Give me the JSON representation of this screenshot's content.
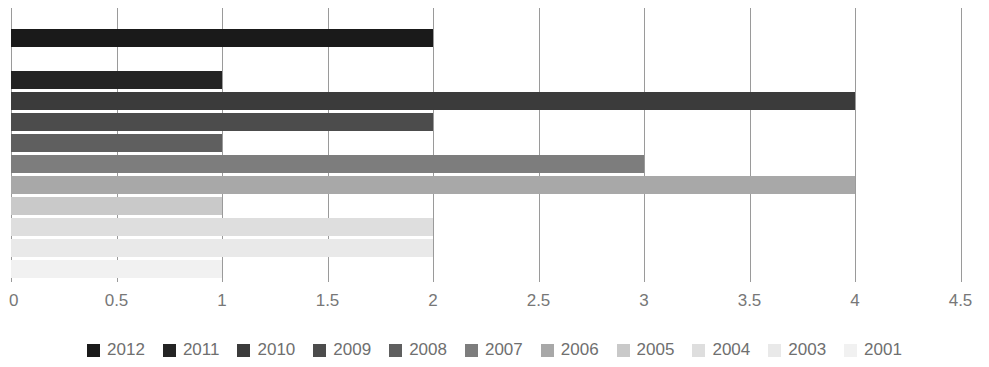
{
  "chart_data": {
    "type": "bar",
    "orientation": "horizontal",
    "title": "",
    "subtitle": "",
    "xlabel": "",
    "ylabel": "",
    "xlim": [
      0,
      4.5
    ],
    "grid": true,
    "grid_axis": "x",
    "legend_position": "bottom",
    "categories": [
      "2012",
      "2011",
      "2010",
      "2009",
      "2008",
      "2007",
      "2006",
      "2005",
      "2004",
      "2003",
      "2001"
    ],
    "values": [
      2,
      1,
      4,
      2,
      1,
      3,
      4,
      1,
      2,
      2,
      1
    ],
    "tick_labels": [
      "0",
      "0.5",
      "1",
      "1.5",
      "2",
      "2.5",
      "3",
      "3.5",
      "4",
      "4.5"
    ],
    "tick_values": [
      0,
      0.5,
      1,
      1.5,
      2,
      2.5,
      3,
      3.5,
      4,
      4.5
    ],
    "series": [
      {
        "name": "2012",
        "value": 2,
        "color": "#1a1a1a"
      },
      {
        "name": "2011",
        "value": 1,
        "color": "#242424"
      },
      {
        "name": "2010",
        "value": 4,
        "color": "#3b3b3b"
      },
      {
        "name": "2009",
        "value": 2,
        "color": "#4c4c4c"
      },
      {
        "name": "2008",
        "value": 1,
        "color": "#5f5f5f"
      },
      {
        "name": "2007",
        "value": 3,
        "color": "#7d7d7d"
      },
      {
        "name": "2006",
        "value": 4,
        "color": "#a8a8a8"
      },
      {
        "name": "2005",
        "value": 1,
        "color": "#c9c9c9"
      },
      {
        "name": "2004",
        "value": 2,
        "color": "#dedede"
      },
      {
        "name": "2003",
        "value": 2,
        "color": "#e9e9e9"
      },
      {
        "name": "2001",
        "value": 1,
        "color": "#f1f1f1"
      }
    ],
    "colors": {
      "gridline": "#9a9a9a",
      "tick_text": "#777777",
      "legend_text": "#6f6f6f",
      "background": "#ffffff"
    }
  },
  "legend": {
    "items": [
      {
        "label": "2012",
        "color": "#1a1a1a"
      },
      {
        "label": "2011",
        "color": "#242424"
      },
      {
        "label": "2010",
        "color": "#3b3b3b"
      },
      {
        "label": "2009",
        "color": "#4c4c4c"
      },
      {
        "label": "2008",
        "color": "#5f5f5f"
      },
      {
        "label": "2007",
        "color": "#7d7d7d"
      },
      {
        "label": "2006",
        "color": "#a8a8a8"
      },
      {
        "label": "2005",
        "color": "#c9c9c9"
      },
      {
        "label": "2004",
        "color": "#dedede"
      },
      {
        "label": "2003",
        "color": "#e9e9e9"
      },
      {
        "label": "2001",
        "color": "#f1f1f1"
      }
    ]
  },
  "layout": {
    "plot_left_px": 11,
    "plot_top_px": 8,
    "plot_height_px": 274,
    "px_per_unit": 211,
    "bar_height_px": 18,
    "row_pitch_px": 21,
    "first_row_top_px": 29,
    "blank_row_index": 1
  }
}
